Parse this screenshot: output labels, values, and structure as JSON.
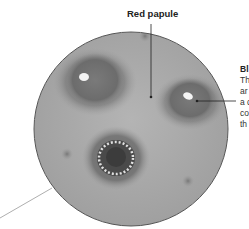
{
  "labels": {
    "top": "Red papule",
    "side_title": "Bl",
    "side_lines": [
      "Th",
      "ar",
      "a c",
      "co",
      "th"
    ]
  },
  "colors": {
    "skin": "#a9a9a9",
    "skin_dark": "#6e6e6e",
    "outline": "#555555",
    "leader": "#222222",
    "leader_light": "#999999"
  }
}
